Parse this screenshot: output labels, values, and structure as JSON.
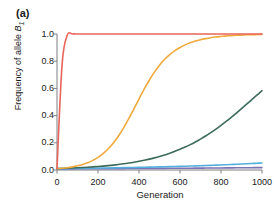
{
  "panel": {
    "label": "(a)"
  },
  "chart_data": {
    "type": "line",
    "title": "",
    "panel_label": "(a)",
    "xlabel": "Generation",
    "ylabel": "Frequency of allele B1",
    "ylabel_base": "Frequency of allele ",
    "ylabel_italic": "B",
    "ylabel_subscript": "1",
    "xlim": [
      0,
      1000
    ],
    "ylim": [
      0.0,
      1.0
    ],
    "xticks": [
      0,
      200,
      400,
      600,
      800,
      1000
    ],
    "xtick_labels": [
      "0",
      "200",
      "400",
      "600",
      "800",
      "1000"
    ],
    "yticks": [
      0.0,
      0.2,
      0.4,
      0.6,
      0.8,
      1.0
    ],
    "ytick_labels": [
      "0.0",
      "0.2",
      "0.4",
      "0.6",
      "0.8",
      "1.0"
    ],
    "grid": false,
    "legend": "none",
    "x": [
      0,
      25,
      50,
      75,
      100,
      125,
      150,
      175,
      200,
      225,
      250,
      275,
      300,
      325,
      350,
      375,
      400,
      425,
      450,
      475,
      500,
      525,
      550,
      575,
      600,
      625,
      650,
      675,
      700,
      725,
      750,
      775,
      800,
      825,
      850,
      875,
      900,
      925,
      950,
      975,
      1000
    ],
    "series": [
      {
        "name": "curve-red",
        "color": "#e8655a",
        "values": [
          0.01,
          0.78,
          0.99,
          1.0,
          1.0,
          1.0,
          1.0,
          1.0,
          1.0,
          1.0,
          1.0,
          1.0,
          1.0,
          1.0,
          1.0,
          1.0,
          1.0,
          1.0,
          1.0,
          1.0,
          1.0,
          1.0,
          1.0,
          1.0,
          1.0,
          1.0,
          1.0,
          1.0,
          1.0,
          1.0,
          1.0,
          1.0,
          1.0,
          1.0,
          1.0,
          1.0,
          1.0,
          1.0,
          1.0,
          1.0,
          1.0
        ]
      },
      {
        "name": "curve-orange",
        "color": "#f0a93c",
        "values": [
          0.01,
          0.013,
          0.017,
          0.023,
          0.031,
          0.041,
          0.054,
          0.071,
          0.093,
          0.121,
          0.156,
          0.199,
          0.25,
          0.31,
          0.377,
          0.449,
          0.522,
          0.594,
          0.66,
          0.72,
          0.771,
          0.814,
          0.849,
          0.878,
          0.901,
          0.92,
          0.935,
          0.948,
          0.958,
          0.966,
          0.973,
          0.978,
          0.982,
          0.986,
          0.988,
          0.991,
          0.992,
          0.994,
          0.995,
          0.996,
          0.997
        ]
      },
      {
        "name": "curve-green",
        "color": "#3d6b5a",
        "values": [
          0.01,
          0.0112,
          0.0126,
          0.0142,
          0.016,
          0.018,
          0.0202,
          0.0227,
          0.0255,
          0.0287,
          0.0322,
          0.0362,
          0.0406,
          0.0455,
          0.051,
          0.0571,
          0.0639,
          0.0715,
          0.0799,
          0.0892,
          0.0995,
          0.1109,
          0.1234,
          0.1372,
          0.1523,
          0.1688,
          0.1868,
          0.2063,
          0.2274,
          0.2501,
          0.2745,
          0.3005,
          0.328,
          0.357,
          0.3873,
          0.4187,
          0.451,
          0.4838,
          0.5169,
          0.55,
          0.583
        ]
      },
      {
        "name": "curve-lightblue",
        "color": "#55aede",
        "values": [
          0.01,
          0.0104,
          0.0108,
          0.0113,
          0.0118,
          0.0123,
          0.0128,
          0.0133,
          0.0139,
          0.0145,
          0.0151,
          0.0157,
          0.0164,
          0.0171,
          0.0178,
          0.0185,
          0.0193,
          0.0201,
          0.021,
          0.0219,
          0.0228,
          0.0237,
          0.0247,
          0.0258,
          0.0268,
          0.028,
          0.0291,
          0.0304,
          0.0316,
          0.033,
          0.0343,
          0.0358,
          0.0373,
          0.0388,
          0.0404,
          0.0421,
          0.0438,
          0.0457,
          0.0476,
          0.0495,
          0.0516
        ]
      },
      {
        "name": "curve-purple",
        "color": "#7b74b4",
        "values": [
          0.008,
          0.0082,
          0.0083,
          0.0085,
          0.0087,
          0.0089,
          0.009,
          0.0092,
          0.0094,
          0.0096,
          0.0098,
          0.01,
          0.0102,
          0.0104,
          0.0106,
          0.0108,
          0.011,
          0.0112,
          0.0114,
          0.0117,
          0.0119,
          0.0121,
          0.0124,
          0.0126,
          0.0129,
          0.0131,
          0.0134,
          0.0137,
          0.0139,
          0.0142,
          0.0145,
          0.0148,
          0.0151,
          0.0154,
          0.0157,
          0.016,
          0.0164,
          0.0167,
          0.017,
          0.0174,
          0.0177
        ]
      }
    ],
    "axis_color": "#7f7f85",
    "text_color": "#1a1a1a"
  }
}
